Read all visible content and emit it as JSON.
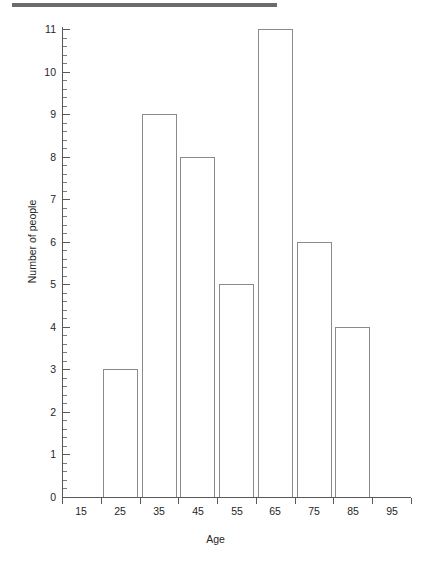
{
  "figure": {
    "top_rule_color": "#6b6b6b",
    "axis_color": "#5a5a5a",
    "bar_stroke_color": "#8a8a8a",
    "bar_fill_color": "#ffffff"
  },
  "chart_data": {
    "type": "bar",
    "title": "",
    "subtitle": "",
    "xlabel": "Age",
    "ylabel": "Number of people",
    "categories": [
      "15",
      "25",
      "35",
      "45",
      "55",
      "65",
      "75",
      "85",
      "95"
    ],
    "values": [
      0,
      3,
      9,
      8,
      5,
      11,
      6,
      4,
      0
    ],
    "bin_edges": [
      10,
      20,
      30,
      40,
      50,
      60,
      70,
      80,
      90,
      100
    ],
    "xlim": [
      10,
      100
    ],
    "ylim": [
      0,
      11
    ],
    "y_tick_labels": [
      "0",
      "1",
      "2",
      "3",
      "4",
      "5",
      "6",
      "7",
      "8",
      "9",
      "10",
      "11"
    ],
    "y_major_step": 1,
    "y_minor_per_major": 5,
    "x_tick_labels": [
      "15",
      "25",
      "35",
      "45",
      "55",
      "65",
      "75",
      "85",
      "95"
    ],
    "grid": false,
    "legend": null,
    "legend_position": "none",
    "annotations": []
  }
}
